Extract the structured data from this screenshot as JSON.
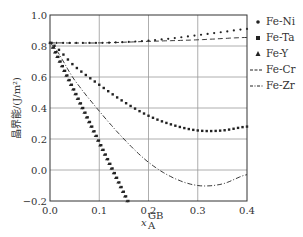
{
  "chart_data": {
    "type": "line",
    "title": "",
    "xlabel": "x_A^GB",
    "ylabel": "晶界能/(J/m²)",
    "xlim": [
      0.0,
      0.4
    ],
    "ylim": [
      -0.2,
      1.0
    ],
    "xticks": [
      "0.0",
      "0.1",
      "0.2",
      "0.3",
      "0.4"
    ],
    "yticks": [
      "1.0",
      "0.8",
      "0.6",
      "0.4",
      "0.2",
      "0.0",
      "−0.2"
    ],
    "grid": true,
    "legend_position": "right",
    "series": [
      {
        "name": "Fe-Ni",
        "marker": "circle",
        "style": "dotted",
        "x": [
          0,
          0.05,
          0.1,
          0.15,
          0.2,
          0.25,
          0.3,
          0.35,
          0.4
        ],
        "y": [
          0.82,
          0.82,
          0.82,
          0.825,
          0.835,
          0.85,
          0.87,
          0.89,
          0.91
        ]
      },
      {
        "name": "Fe-Ta",
        "marker": "square",
        "style": "dotted",
        "x": [
          0,
          0.05,
          0.1,
          0.15,
          0.2,
          0.25,
          0.3,
          0.35,
          0.4
        ],
        "y": [
          0.82,
          0.67,
          0.55,
          0.44,
          0.35,
          0.29,
          0.255,
          0.255,
          0.28
        ]
      },
      {
        "name": "Fe-Y",
        "marker": "triangle",
        "style": "dotted",
        "x": [
          0,
          0.05,
          0.1,
          0.126,
          0.156
        ],
        "y": [
          0.82,
          0.49,
          0.17,
          0.0,
          -0.2
        ]
      },
      {
        "name": "Fe-Cr",
        "marker": "none",
        "style": "dashed",
        "x": [
          0,
          0.1,
          0.2,
          0.3,
          0.4
        ],
        "y": [
          0.82,
          0.82,
          0.83,
          0.84,
          0.855
        ]
      },
      {
        "name": "Fe-Zr",
        "marker": "none",
        "style": "dash-dot",
        "x": [
          0,
          0.05,
          0.1,
          0.15,
          0.2,
          0.25,
          0.3,
          0.35,
          0.4
        ],
        "y": [
          0.82,
          0.58,
          0.38,
          0.2,
          0.05,
          -0.05,
          -0.1,
          -0.09,
          -0.03
        ]
      }
    ]
  },
  "legend": [
    {
      "label": "Fe-Ni",
      "symbol": "•"
    },
    {
      "label": "Fe-Ta",
      "symbol": "■"
    },
    {
      "label": "Fe-Y",
      "symbol": "▲"
    },
    {
      "label": "Fe-Cr",
      "symbol": "---"
    },
    {
      "label": "Fe-Zr",
      "symbol": "-·-"
    }
  ],
  "axes": {
    "ylabel_text": "晶界能/(J/m²)",
    "xlabel_main": "x",
    "xlabel_sub": "A",
    "xlabel_sup": "GB"
  }
}
